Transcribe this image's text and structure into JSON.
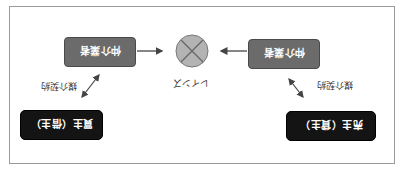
{
  "diagram": {
    "hub": {
      "label": "レインズ",
      "fill": "#b3b3b3",
      "stroke": "#777777"
    },
    "brokers": [
      {
        "label": "仲介業者",
        "side": "seller"
      },
      {
        "label": "仲介業者",
        "side": "buyer"
      }
    ],
    "parties": [
      {
        "label": "売主（貸主）"
      },
      {
        "label": "買主（借主）"
      }
    ],
    "contracts": [
      {
        "label": "媒介契約"
      },
      {
        "label": "媒介契約"
      }
    ],
    "colors": {
      "broker_box": "#6b6b6b",
      "party_box": "#141414",
      "arrow": "#444444",
      "frame": "#9a9a9a"
    },
    "orientation": "rotated-180"
  }
}
